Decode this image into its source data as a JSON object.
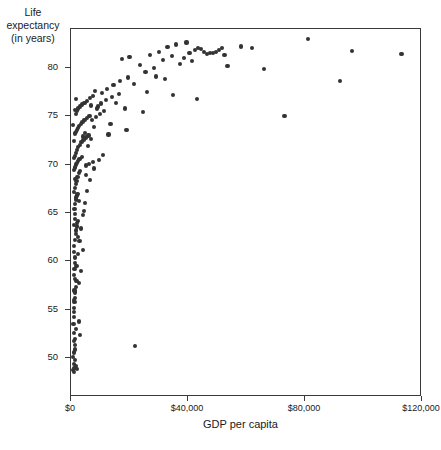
{
  "chart_data": {
    "type": "scatter",
    "title": "",
    "xlabel": "GDP per capita",
    "ylabel": "Life expectancy (in years)",
    "ylabel_lines": [
      "Life",
      "expectancy",
      "(in years)"
    ],
    "xlim": [
      0,
      120000
    ],
    "ylim": [
      46,
      84
    ],
    "grid": false,
    "legend": null,
    "xticks": [
      0,
      40000,
      80000,
      120000
    ],
    "xtick_labels": [
      "$0",
      "$40,000",
      "$80,000",
      "$120,000"
    ],
    "yticks": [
      50,
      55,
      60,
      65,
      70,
      75,
      80
    ],
    "ytick_labels": [
      "50",
      "55",
      "60",
      "65",
      "70",
      "75",
      "80"
    ],
    "marker_color": "#333333",
    "marker_size": 4,
    "points": [
      [
        700,
        50.1
      ],
      [
        800,
        48.8
      ],
      [
        900,
        49.4
      ],
      [
        1000,
        48.6
      ],
      [
        1100,
        50.6
      ],
      [
        1200,
        49.0
      ],
      [
        1300,
        51.4
      ],
      [
        1400,
        52.0
      ],
      [
        1500,
        49.8
      ],
      [
        1600,
        53.0
      ],
      [
        900,
        54.3
      ],
      [
        1000,
        54.8
      ],
      [
        1100,
        55.2
      ],
      [
        1200,
        55.8
      ],
      [
        1400,
        56.2
      ],
      [
        1500,
        56.8
      ],
      [
        1700,
        57.4
      ],
      [
        1900,
        58.0
      ],
      [
        1000,
        58.6
      ],
      [
        1200,
        59.2
      ],
      [
        1300,
        59.8
      ],
      [
        1500,
        60.4
      ],
      [
        900,
        61.0
      ],
      [
        1100,
        61.6
      ],
      [
        1400,
        62.2
      ],
      [
        1600,
        62.8
      ],
      [
        1800,
        63.2
      ],
      [
        1000,
        63.8
      ],
      [
        1300,
        64.4
      ],
      [
        1500,
        64.9
      ],
      [
        2000,
        63.6
      ],
      [
        2300,
        64.2
      ],
      [
        1200,
        65.4
      ],
      [
        1500,
        65.9
      ],
      [
        1800,
        66.4
      ],
      [
        2100,
        66.8
      ],
      [
        1000,
        67.2
      ],
      [
        1300,
        67.6
      ],
      [
        1600,
        68.0
      ],
      [
        1900,
        68.3
      ],
      [
        2200,
        68.7
      ],
      [
        2600,
        69.1
      ],
      [
        1100,
        69.4
      ],
      [
        1400,
        69.7
      ],
      [
        1700,
        70.0
      ],
      [
        2000,
        70.2
      ],
      [
        2400,
        70.4
      ],
      [
        2900,
        70.6
      ],
      [
        5200,
        69.9
      ],
      [
        6100,
        70.1
      ],
      [
        7400,
        70.3
      ],
      [
        1500,
        70.9
      ],
      [
        1800,
        71.2
      ],
      [
        2100,
        71.5
      ],
      [
        2500,
        71.8
      ],
      [
        3000,
        72.0
      ],
      [
        3600,
        72.3
      ],
      [
        4300,
        72.5
      ],
      [
        5100,
        72.8
      ],
      [
        6000,
        73.0
      ],
      [
        1300,
        73.2
      ],
      [
        1700,
        73.4
      ],
      [
        2000,
        73.6
      ],
      [
        2400,
        73.8
      ],
      [
        2800,
        74.0
      ],
      [
        3300,
        74.2
      ],
      [
        3900,
        74.4
      ],
      [
        4600,
        74.6
      ],
      [
        5400,
        74.8
      ],
      [
        6300,
        75.0
      ],
      [
        7300,
        74.6
      ],
      [
        8500,
        74.9
      ],
      [
        9800,
        75.2
      ],
      [
        11200,
        75.5
      ],
      [
        1600,
        75.2
      ],
      [
        2000,
        75.5
      ],
      [
        2500,
        75.8
      ],
      [
        3100,
        76.0
      ],
      [
        3800,
        76.2
      ],
      [
        4600,
        76.4
      ],
      [
        5500,
        76.6
      ],
      [
        6500,
        76.9
      ],
      [
        7600,
        77.1
      ],
      [
        8800,
        75.8
      ],
      [
        10200,
        76.3
      ],
      [
        12000,
        76.7
      ],
      [
        14000,
        77.0
      ],
      [
        16500,
        77.3
      ],
      [
        19000,
        73.6
      ],
      [
        13500,
        74.2
      ],
      [
        22000,
        51.3
      ],
      [
        2200,
        67.0
      ],
      [
        2700,
        66.2
      ],
      [
        3200,
        69.3
      ],
      [
        3700,
        70.8
      ],
      [
        4200,
        72.9
      ],
      [
        4900,
        73.3
      ],
      [
        5800,
        71.9
      ],
      [
        6800,
        72.6
      ],
      [
        8000,
        73.9
      ],
      [
        9200,
        76.0
      ],
      [
        10600,
        77.4
      ],
      [
        12400,
        77.8
      ],
      [
        14500,
        78.2
      ],
      [
        16800,
        78.6
      ],
      [
        19500,
        79.0
      ],
      [
        21500,
        78.3
      ],
      [
        23500,
        80.3
      ],
      [
        25500,
        79.6
      ],
      [
        27000,
        81.3
      ],
      [
        28500,
        80.0
      ],
      [
        30000,
        81.6
      ],
      [
        31500,
        80.8
      ],
      [
        33000,
        82.1
      ],
      [
        34500,
        81.2
      ],
      [
        36000,
        82.4
      ],
      [
        37200,
        80.4
      ],
      [
        38500,
        81.0
      ],
      [
        39500,
        82.6
      ],
      [
        40500,
        81.5
      ],
      [
        41500,
        80.7
      ],
      [
        42500,
        81.8
      ],
      [
        43500,
        82.0
      ],
      [
        44500,
        81.9
      ],
      [
        45500,
        81.6
      ],
      [
        46500,
        81.4
      ],
      [
        47500,
        81.5
      ],
      [
        48500,
        81.5
      ],
      [
        49500,
        81.6
      ],
      [
        50500,
        81.8
      ],
      [
        51500,
        82.0
      ],
      [
        52500,
        81.3
      ],
      [
        53500,
        80.2
      ],
      [
        26000,
        77.5
      ],
      [
        29000,
        79.1
      ],
      [
        32000,
        78.8
      ],
      [
        35000,
        77.2
      ],
      [
        43000,
        76.8
      ],
      [
        24500,
        75.4
      ],
      [
        58000,
        82.2
      ],
      [
        62000,
        82.0
      ],
      [
        66000,
        79.9
      ],
      [
        73000,
        75.0
      ],
      [
        81000,
        83.0
      ],
      [
        92000,
        78.6
      ],
      [
        96000,
        81.7
      ],
      [
        113000,
        81.4
      ],
      [
        17500,
        80.9
      ],
      [
        20000,
        81.1
      ],
      [
        15500,
        76.4
      ],
      [
        18500,
        75.8
      ],
      [
        12800,
        73.1
      ],
      [
        11000,
        71.0
      ],
      [
        9500,
        70.5
      ],
      [
        7900,
        69.6
      ],
      [
        6600,
        68.4
      ],
      [
        5600,
        67.3
      ],
      [
        4800,
        66.0
      ],
      [
        4100,
        64.8
      ],
      [
        3500,
        63.4
      ],
      [
        2900,
        62.1
      ],
      [
        2400,
        60.8
      ],
      [
        1900,
        59.5
      ],
      [
        1500,
        58.2
      ],
      [
        1200,
        57.0
      ],
      [
        1000,
        56.0
      ],
      [
        850,
        53.5
      ],
      [
        950,
        52.6
      ],
      [
        1150,
        51.8
      ],
      [
        1350,
        50.9
      ],
      [
        1600,
        49.2
      ],
      [
        2000,
        48.9
      ],
      [
        2600,
        53.8
      ],
      [
        3200,
        52.4
      ],
      [
        2800,
        57.8
      ],
      [
        3400,
        59.0
      ],
      [
        4000,
        61.2
      ],
      [
        4500,
        65.2
      ],
      [
        5000,
        68.9
      ],
      [
        2500,
        62.5
      ],
      [
        2100,
        64.0
      ],
      [
        1700,
        66.6
      ],
      [
        1400,
        68.5
      ],
      [
        1100,
        70.7
      ],
      [
        900,
        72.4
      ],
      [
        800,
        74.1
      ],
      [
        1250,
        75.6
      ],
      [
        1750,
        76.8
      ],
      [
        6900,
        76.1
      ],
      [
        8300,
        77.6
      ]
    ]
  }
}
